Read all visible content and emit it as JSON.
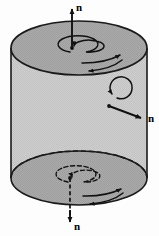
{
  "figure": {
    "kind": "cylinder-normal-vectors-diagram",
    "background_color": "#fdfdfd",
    "outline_color": "#1a1a1a",
    "top_face_color": "#a9a9a9",
    "bottom_face_color": "#a3a3a3",
    "side_wall_color": "#cfcfcf"
  },
  "labels": {
    "top_normal": "n",
    "side_normal": "n",
    "bottom_normal": "n"
  },
  "arrows": {
    "top_normal_name": "upward-normal-arrow",
    "side_normal_name": "radial-normal-arrow",
    "bottom_normal_name": "downward-normal-arrow",
    "top_spiral_name": "top-face-rotation-spiral",
    "bottom_spiral_name": "bottom-face-rotation-spiral",
    "side_rotation_name": "side-rotation-circle",
    "top_circulation_name": "top-circumferential-arrows",
    "bottom_circulation_name": "bottom-circumferential-arrows"
  }
}
